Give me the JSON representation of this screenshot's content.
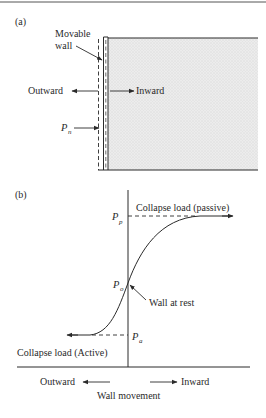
{
  "panel_a": {
    "label": "(a)",
    "wall_label_line1": "Movable",
    "wall_label_line2": "wall",
    "outward": "Outward",
    "inward": "Inward",
    "force_symbol": "P",
    "force_subscript": "n"
  },
  "panel_b": {
    "label": "(b)",
    "passive_label": "Collapse load (passive)",
    "active_label": "Collapse load (Active)",
    "rest_label": "Wall at rest",
    "pp_symbol": "P",
    "pp_subscript": "p",
    "po_symbol": "P",
    "po_subscript": "o",
    "pa_symbol": "P",
    "pa_subscript": "a",
    "outward": "Outward",
    "inward": "Inward",
    "x_axis_label": "Wall movement"
  },
  "colors": {
    "line": "#2a2a2a",
    "soil_fill": "#e9e9e9"
  }
}
